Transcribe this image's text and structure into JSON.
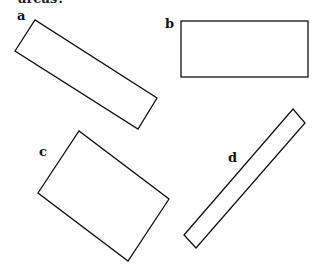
{
  "caption": "areas?",
  "shapes": [
    {
      "label": "a",
      "points": "15,155 35,20 157,98 138,129"
    },
    {
      "label": "b"
    },
    {
      "label": "c"
    },
    {
      "label": "d"
    }
  ],
  "colors": {
    "stroke": "#111111",
    "background": "#ffffff"
  }
}
